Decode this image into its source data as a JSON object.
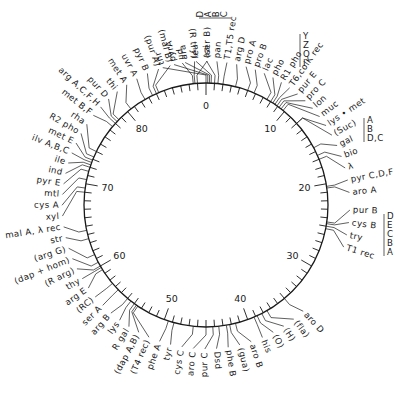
{
  "diagram": {
    "type": "circular-genetic-map",
    "scale": {
      "min": 0,
      "max": 90,
      "unit": "minutes",
      "major_ticks": [
        0,
        10,
        20,
        30,
        40,
        50,
        60,
        70,
        80
      ],
      "minor_tick_step": 1
    },
    "geometry": {
      "cx": 206,
      "cy": 205,
      "r": 122
    },
    "colors": {
      "ink": "#1a1a1a",
      "background": "#ffffff"
    },
    "loci": [
      {
        "label": "thr",
        "pos": 0.0,
        "side": "top"
      },
      {
        "label": "pyrA",
        "pos": 0.2
      },
      {
        "label": "ara",
        "pos": 0.4
      },
      {
        "label": "leu",
        "pos": 0.6
      },
      {
        "label": "azi",
        "pos": 1.0
      },
      {
        "label": "pan",
        "pos": 1.4
      },
      {
        "label": "T1,T5 rec",
        "pos": 2.0
      },
      {
        "label": "pil",
        "pos": 88.5
      },
      {
        "label": "(R try)",
        "pos": 88.7
      },
      {
        "label": "(ser B)",
        "pos": 89.0
      },
      {
        "label": "arg D",
        "pos": 3.5
      },
      {
        "label": "pro A",
        "pos": 5.0
      },
      {
        "label": "pro B",
        "pos": 5.8
      },
      {
        "label": "lac",
        "pos": 7.5
      },
      {
        "label": "pho",
        "pos": 8.0
      },
      {
        "label": "R1 pho",
        "pos": 8.3
      },
      {
        "label": "T6,colK rec",
        "pos": 8.6
      },
      {
        "label": "pur E",
        "pos": 8.9
      },
      {
        "label": "pro C",
        "pos": 9.2
      },
      {
        "label": "lon",
        "pos": 9.5
      },
      {
        "label": "muc",
        "pos": 9.8
      },
      {
        "label": "lys • met",
        "pos": 12.0
      },
      {
        "label": "(Suc)",
        "pos": 12.0
      },
      {
        "label": "gal",
        "pos": 15.5
      },
      {
        "label": "bio",
        "pos": 16.5
      },
      {
        "label": "λ",
        "pos": 17.0
      },
      {
        "label": "pyr C,D,F",
        "pos": 20.3
      },
      {
        "label": "aro A",
        "pos": 20.5
      },
      {
        "label": "pur B",
        "pos": 24.5
      },
      {
        "label": "cys B",
        "pos": 24.7
      },
      {
        "label": "try",
        "pos": 25.0
      },
      {
        "label": "T1 rec",
        "pos": 25.3
      },
      {
        "label": "aro D",
        "pos": 35.0
      },
      {
        "label": "(fla)",
        "pos": 37.5
      },
      {
        "label": "(H)",
        "pos": 38.2
      },
      {
        "label": "(O)",
        "pos": 38.8
      },
      {
        "label": "his",
        "pos": 39.2
      },
      {
        "label": "aro B",
        "pos": 41.5
      },
      {
        "label": "(gua)",
        "pos": 42.2
      },
      {
        "label": "phe B",
        "pos": 42.6
      },
      {
        "label": "Dsd",
        "pos": 43.5
      },
      {
        "label": "pur C",
        "pos": 44.2
      },
      {
        "label": "aro C",
        "pos": 45.0
      },
      {
        "label": "cys C",
        "pos": 46.5
      },
      {
        "label": "tyr",
        "pos": 48.8
      },
      {
        "label": "phe A",
        "pos": 49.5
      },
      {
        "label": "(T4 rec)",
        "pos": 53.5
      },
      {
        "label": "(dap A,B)",
        "pos": 53.7
      },
      {
        "label": "R gal",
        "pos": 54.0
      },
      {
        "label": "lys",
        "pos": 54.5
      },
      {
        "label": "arg B",
        "pos": 55.0
      },
      {
        "label": "ser A",
        "pos": 56.5
      },
      {
        "label": "(RC)",
        "pos": 57.5
      },
      {
        "label": "arg E",
        "pos": 59.5
      },
      {
        "label": "thy",
        "pos": 59.8
      },
      {
        "label": "(R arg)",
        "pos": 60.0
      },
      {
        "label": "(dap + hom)",
        "pos": 60.5
      },
      {
        "label": "(arg G)",
        "pos": 61.5
      },
      {
        "label": "str",
        "pos": 63.5
      },
      {
        "label": "mal A, λ rec",
        "pos": 64.5
      },
      {
        "label": "xyl",
        "pos": 69.0
      },
      {
        "label": "cys A",
        "pos": 69.5
      },
      {
        "label": "mtl",
        "pos": 70.5
      },
      {
        "label": "pyr E",
        "pos": 71.5
      },
      {
        "label": "ind",
        "pos": 72.0
      },
      {
        "label": "ile",
        "pos": 72.3
      },
      {
        "label": "ilv A,B,C",
        "pos": 72.6
      },
      {
        "label": "met E",
        "pos": 72.9
      },
      {
        "label": "R2 pho",
        "pos": 73.3
      },
      {
        "label": "rha",
        "pos": 74.0
      },
      {
        "label": "met B,F",
        "pos": 77.5
      },
      {
        "label": "arg A,C,F,H",
        "pos": 78.0
      },
      {
        "label": "pur D",
        "pos": 78.3
      },
      {
        "label": "thi",
        "pos": 78.6
      },
      {
        "label": "met A",
        "pos": 80.5
      },
      {
        "label": "uvr A",
        "pos": 82.5
      },
      {
        "label": "pyr B",
        "pos": 83.5
      },
      {
        "label": "(pur A)",
        "pos": 84.0
      },
      {
        "label": "(mal B)",
        "pos": 84.3
      }
    ],
    "gene_clusters": [
      {
        "locus": "ara",
        "genes": [
          "D",
          "A",
          "B",
          "C"
        ]
      },
      {
        "locus": "lac",
        "genes": [
          "Y",
          "Z",
          "O",
          "I"
        ]
      },
      {
        "locus": "gal",
        "genes": [
          "A",
          "B",
          "D,C"
        ]
      },
      {
        "locus": "try",
        "genes": [
          "D",
          "E",
          "C",
          "B",
          "A"
        ]
      }
    ]
  }
}
